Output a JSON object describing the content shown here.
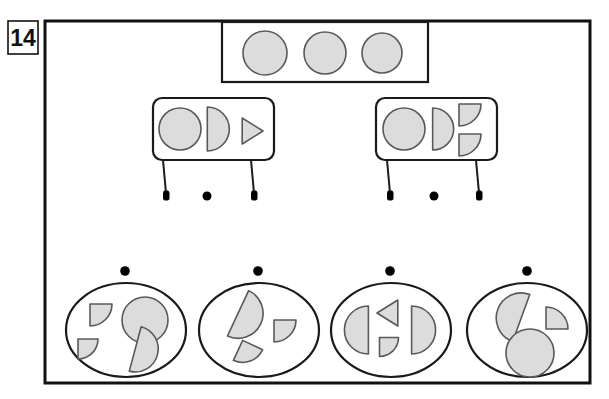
{
  "page": {
    "item_number": "14",
    "width": 609,
    "height": 399
  },
  "colors": {
    "background": "#ffffff",
    "outline": "#1a1a1a",
    "shape_fill": "#dcdcdc",
    "shape_stroke": "#595959",
    "dot": "#000000",
    "frame": "#111111"
  },
  "frame": {
    "x": 45,
    "y": 21,
    "width": 545,
    "height": 362,
    "stroke_width": 3
  },
  "number_badge": {
    "label": "14",
    "x": 8,
    "y": 21,
    "width": 30,
    "height": 33
  },
  "top_panel": {
    "name": "top-rectangle-tray",
    "x": 222,
    "y": 22,
    "width": 206,
    "height": 60,
    "shapes": [
      {
        "kind": "circle",
        "cx": 265,
        "cy": 53,
        "r": 22,
        "rotation": 0
      },
      {
        "kind": "circle",
        "cx": 325,
        "cy": 53,
        "r": 21,
        "rotation": 0
      },
      {
        "kind": "circle",
        "cx": 382,
        "cy": 53,
        "r": 20,
        "rotation": 0
      }
    ]
  },
  "tables": [
    {
      "name": "table-left",
      "top_x": 153,
      "top_y": 98,
      "top_width": 121,
      "top_height": 62,
      "leg_left_x": 163,
      "leg_right_x": 251,
      "leg_top_y": 160,
      "leg_bottom_y": 200,
      "foot_dot_x": 207,
      "foot_dot_y": 200,
      "shapes": [
        {
          "kind": "circle",
          "cx": 180,
          "cy": 129,
          "r": 21,
          "rotation": 0
        },
        {
          "kind": "half",
          "cx": 215,
          "cy": 129,
          "r": 22,
          "rotation": 0
        },
        {
          "kind": "triangle",
          "cx": 250,
          "cy": 131,
          "r": 13,
          "rotation": 0
        }
      ]
    },
    {
      "name": "table-right",
      "top_x": 376,
      "top_y": 98,
      "top_width": 121,
      "top_height": 62,
      "leg_left_x": 387,
      "leg_right_x": 476,
      "leg_top_y": 160,
      "leg_bottom_y": 200,
      "foot_dot_x": 434,
      "foot_dot_y": 200,
      "shapes": [
        {
          "kind": "circle",
          "cx": 404,
          "cy": 129,
          "r": 21,
          "rotation": 0
        },
        {
          "kind": "half",
          "cx": 440,
          "cy": 129,
          "r": 21,
          "rotation": 0
        },
        {
          "kind": "quarter",
          "cx": 470,
          "cy": 115,
          "r": 22,
          "rotation": 0
        },
        {
          "kind": "quarter",
          "cx": 470,
          "cy": 145,
          "r": 22,
          "rotation": 0
        }
      ]
    }
  ],
  "options": [
    {
      "name": "option-1",
      "dot_x": 125,
      "dot_y": 271,
      "cx": 126,
      "cy": 330,
      "rx": 60,
      "ry": 47,
      "shapes": [
        {
          "kind": "quarter",
          "cx": 101,
          "cy": 315,
          "r": 22,
          "rotation": 0
        },
        {
          "kind": "quarter",
          "cx": 88,
          "cy": 349,
          "r": 20,
          "rotation": 0
        },
        {
          "kind": "circle",
          "cx": 145,
          "cy": 320,
          "r": 23,
          "rotation": 0
        },
        {
          "kind": "half",
          "cx": 143,
          "cy": 351,
          "r": 23,
          "rotation": 15
        }
      ]
    },
    {
      "name": "option-2",
      "dot_x": 258,
      "dot_y": 271,
      "cx": 259,
      "cy": 330,
      "rx": 60,
      "ry": 47,
      "shapes": [
        {
          "kind": "half",
          "cx": 246,
          "cy": 317,
          "r": 25,
          "rotation": 25
        },
        {
          "kind": "quarter",
          "cx": 285,
          "cy": 331,
          "r": 22,
          "rotation": 0
        },
        {
          "kind": "quarter",
          "cx": 248,
          "cy": 355,
          "r": 22,
          "rotation": 25
        }
      ]
    },
    {
      "name": "option-3",
      "dot_x": 390,
      "dot_y": 271,
      "cx": 391,
      "cy": 330,
      "rx": 60,
      "ry": 47,
      "shapes": [
        {
          "kind": "half",
          "cx": 360,
          "cy": 330,
          "r": 24,
          "rotation": 180
        },
        {
          "kind": "triangle",
          "cx": 390,
          "cy": 313,
          "r": 13,
          "rotation": 180
        },
        {
          "kind": "quarter",
          "cx": 389,
          "cy": 347,
          "r": 19,
          "rotation": 0
        },
        {
          "kind": "half",
          "cx": 420,
          "cy": 330,
          "r": 24,
          "rotation": 0
        }
      ]
    },
    {
      "name": "option-4",
      "dot_x": 527,
      "dot_y": 271,
      "cx": 527,
      "cy": 330,
      "rx": 60,
      "ry": 47,
      "shapes": [
        {
          "kind": "half",
          "cx": 513,
          "cy": 315,
          "r": 25,
          "rotation": 200
        },
        {
          "kind": "quarter",
          "cx": 557,
          "cy": 318,
          "r": 22,
          "rotation": 270
        },
        {
          "kind": "circle",
          "cx": 530,
          "cy": 353,
          "r": 24,
          "rotation": 0
        }
      ]
    }
  ]
}
